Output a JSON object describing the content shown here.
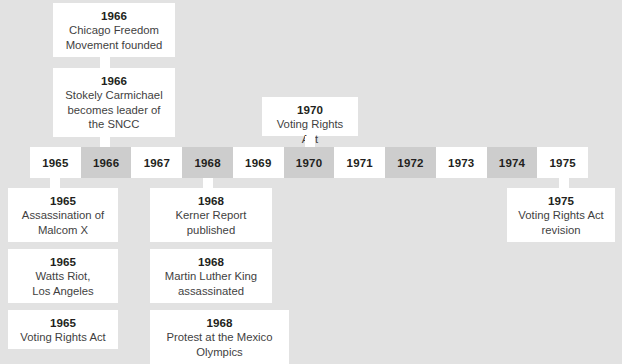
{
  "figure": {
    "type": "timeline",
    "background_color": "#e2e2e2",
    "box_color": "#ffffff",
    "axis_light_color": "#ffffff",
    "axis_dark_color": "#cdcdcd",
    "text_color": "#3f3f3f",
    "heading_color": "#231f20"
  },
  "axis": {
    "years": [
      {
        "label": "1965",
        "shade": "light"
      },
      {
        "label": "1966",
        "shade": "dark"
      },
      {
        "label": "1967",
        "shade": "light"
      },
      {
        "label": "1968",
        "shade": "dark"
      },
      {
        "label": "1969",
        "shade": "light"
      },
      {
        "label": "1970",
        "shade": "dark"
      },
      {
        "label": "1971",
        "shade": "light"
      },
      {
        "label": "1972",
        "shade": "dark"
      },
      {
        "label": "1973",
        "shade": "light"
      },
      {
        "label": "1974",
        "shade": "dark"
      },
      {
        "label": "1975",
        "shade": "light"
      }
    ]
  },
  "events_above": [
    {
      "year": "1966",
      "text": "Chicago Freedom\nMovement founded"
    },
    {
      "year": "1966",
      "text": "Stokely Carmichael\nbecomes leader of\nthe SNCC"
    },
    {
      "year": "1970",
      "text": "Voting Rights Act"
    }
  ],
  "events_below": [
    {
      "year": "1965",
      "text": "Assassination of\nMalcom X"
    },
    {
      "year": "1965",
      "text": "Watts Riot,\nLos Angeles"
    },
    {
      "year": "1965",
      "text": "Voting Rights Act"
    },
    {
      "year": "1968",
      "text": "Kerner Report\npublished"
    },
    {
      "year": "1968",
      "text": "Martin Luther King\nassassinated"
    },
    {
      "year": "1968",
      "text": "Protest at the Mexico\nOlympics"
    },
    {
      "year": "1975",
      "text": "Voting Rights Act\nrevision"
    }
  ]
}
